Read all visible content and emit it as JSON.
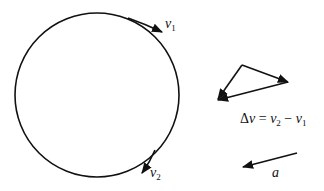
{
  "diagram": {
    "circle": {
      "cx": 97,
      "cy": 95,
      "r": 82
    },
    "vectors": {
      "v1": {
        "label": "v",
        "subscript": "1"
      },
      "v2": {
        "label": "v",
        "subscript": "2"
      },
      "a": {
        "label": "a"
      }
    },
    "equation": {
      "delta": "Δ",
      "lhs": "v",
      "equals": " = ",
      "term1": "v",
      "term1_sub": "2",
      "minus": " − ",
      "term2": "v",
      "term2_sub": "1"
    },
    "stroke_color": "#111111"
  }
}
